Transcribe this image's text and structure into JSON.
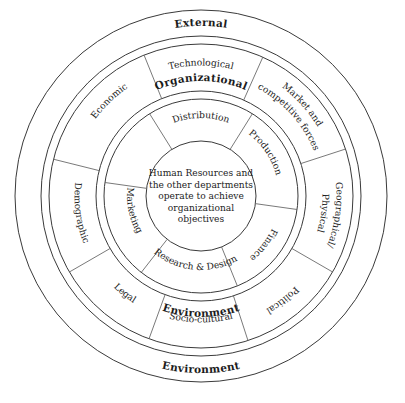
{
  "diagram": {
    "geometry": {
      "center_x": 201,
      "center_y": 196,
      "r_outer_band_out": 186,
      "r_outer_band_in": 160,
      "r_mid_band_out": 152,
      "r_mid_band_in": 105,
      "r_inner_band_out": 97,
      "r_inner_band_in": 55,
      "r_core": 52
    },
    "colors": {
      "stroke": "#3a3a3a",
      "divider": "#6a6a6a",
      "text": "#1c1c1c",
      "background": "#ffffff"
    },
    "outer_band": {
      "top_label": "External",
      "bottom_label": "Environment"
    },
    "middle_band": {
      "top_label": "Organizational",
      "bottom_label": "Environment",
      "segments": [
        {
          "id": "technological",
          "label": "Technological",
          "angle": -90,
          "flip": false
        },
        {
          "id": "market-and-competitive-forces",
          "label": "Market and",
          "label2": "competitive forces",
          "angle": -42,
          "flip": false
        },
        {
          "id": "geographical-physical",
          "label": "Geographical/",
          "label2": "Physical",
          "angle": 8,
          "flip": false
        },
        {
          "id": "political",
          "label": "Political",
          "angle": 52,
          "flip": false
        },
        {
          "id": "socio-cultural",
          "label": "Socio-cultural",
          "angle": 90,
          "flip": true
        },
        {
          "id": "legal",
          "label": "Legal",
          "angle": 128,
          "flip": true
        },
        {
          "id": "demographic",
          "label": "Demographic",
          "angle": 172,
          "flip": true
        },
        {
          "id": "economic",
          "label": "Economic",
          "angle": -134,
          "flip": false
        }
      ]
    },
    "inner_band": {
      "segments": [
        {
          "id": "distribution",
          "label": "Distribution",
          "angle": -90,
          "flip": false
        },
        {
          "id": "production",
          "label": "Production",
          "angle": -34,
          "flip": false
        },
        {
          "id": "finance",
          "label": "Finance",
          "angle": 38,
          "flip": false
        },
        {
          "id": "research-and-design",
          "label": "Research & Design",
          "angle": 95,
          "flip": true
        },
        {
          "id": "marketing",
          "label": "Marketing",
          "angle": 168,
          "flip": true
        }
      ]
    },
    "core": {
      "lines": [
        "Human Resources and",
        "the other departments",
        "operate to achieve",
        "organizational",
        "objectives"
      ]
    }
  }
}
